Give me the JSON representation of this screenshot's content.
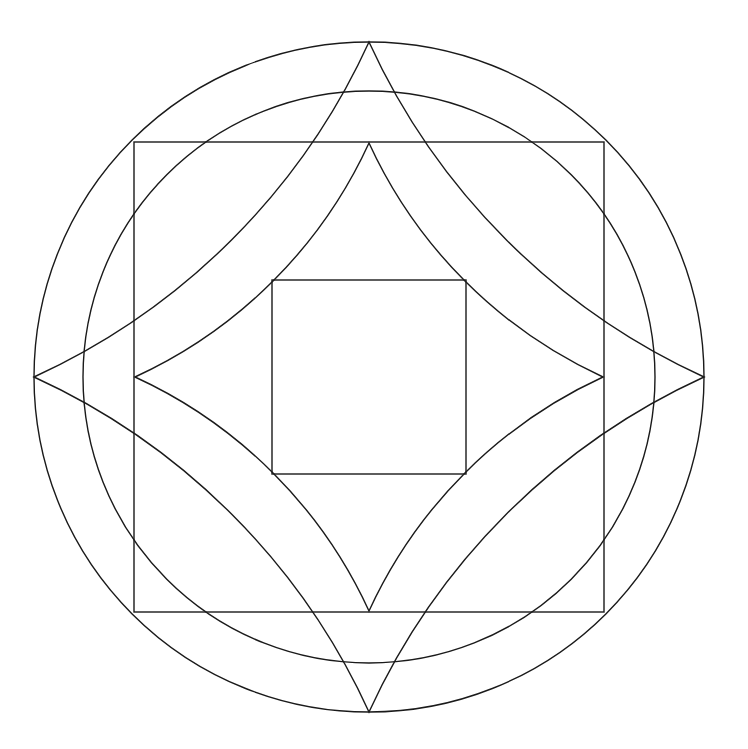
{
  "diagram": {
    "stroke_color": "#1a1a1a",
    "background": "#ffffff",
    "center": [
      369,
      377
    ],
    "outer_circle_radius": 335,
    "inner_circle_radius": 286,
    "outer_square_half_side": 235,
    "inner_square_half_side": 97,
    "outer_star": {
      "tip_radius": 335,
      "arc_offset": 616,
      "arc_radius": 677
    },
    "inner_star": {
      "tip_radius": 234,
      "arc_offset": 432,
      "arc_radius": 475
    }
  }
}
